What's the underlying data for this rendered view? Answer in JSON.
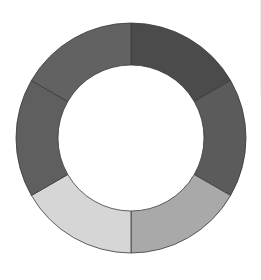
{
  "chart_data": {
    "type": "pie",
    "variant": "donut",
    "title": "",
    "labels": [
      "Segment 1",
      "Segment 2",
      "Segment 3",
      "Segment 4",
      "Segment 5",
      "Segment 6"
    ],
    "values": [
      16.67,
      16.67,
      16.67,
      16.67,
      16.67,
      16.67
    ],
    "colors": [
      "#4b4b4b",
      "#5b5b5b",
      "#a9a9a9",
      "#d6d6d6",
      "#5f5f5f",
      "#626262"
    ],
    "start_angle_deg": 0,
    "direction": "clockwise",
    "center": [
      131,
      138
    ],
    "outer_radius": 115,
    "inner_radius": 73,
    "stroke_color": "#3a3a3a",
    "legend": "none"
  }
}
